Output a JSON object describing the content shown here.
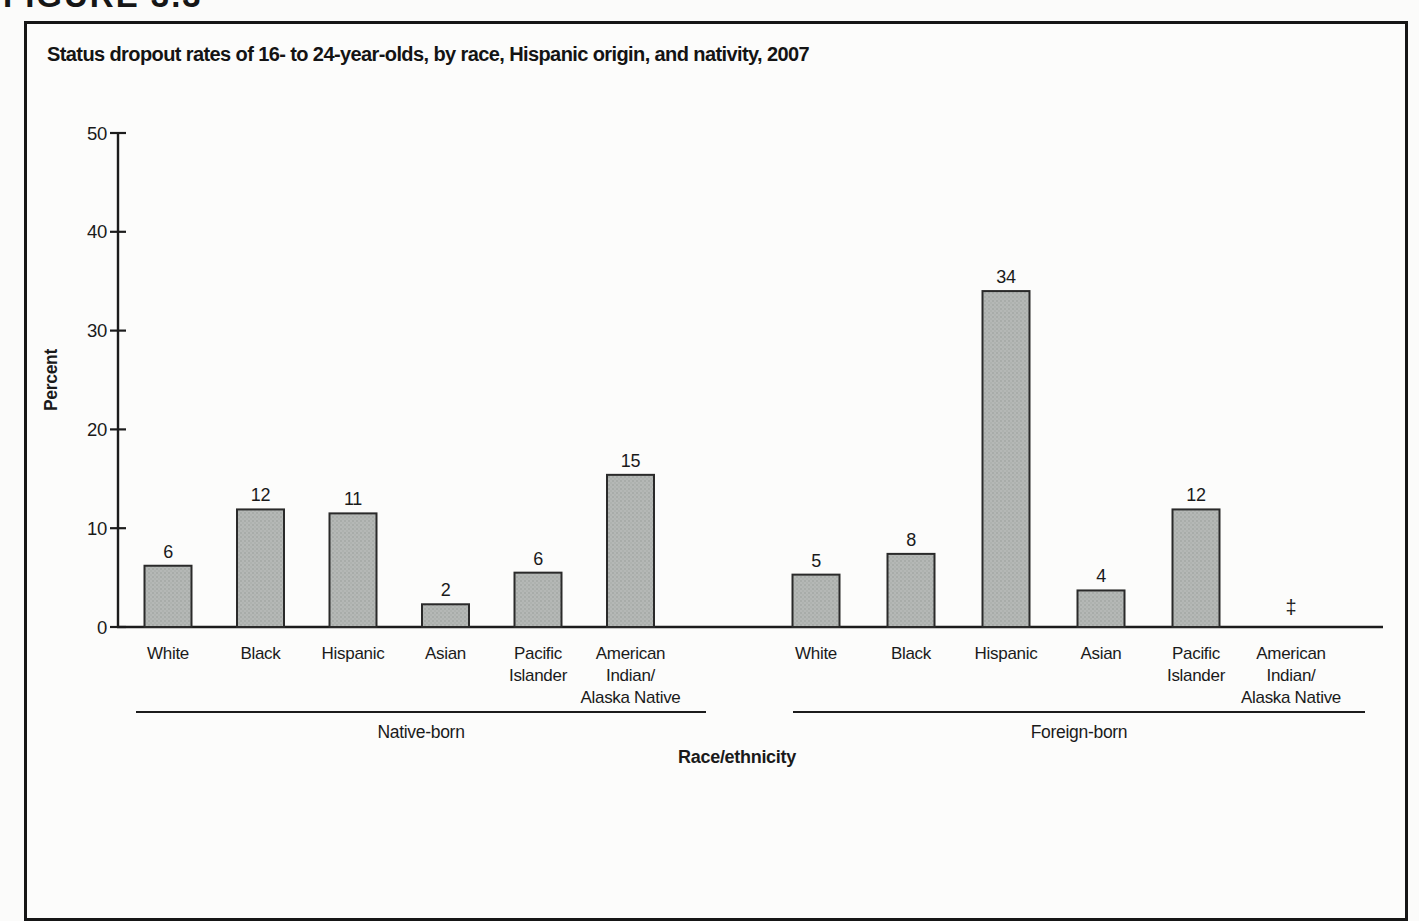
{
  "figure_label": "FIGURE 3.3",
  "chart_data": {
    "type": "bar",
    "title": "Status dropout rates of 16- to 24-year-olds, by race, Hispanic origin, and nativity, 2007",
    "xlabel": "Race/ethnicity",
    "ylabel": "Percent",
    "ylim": [
      0,
      50
    ],
    "yticks": [
      0,
      10,
      20,
      30,
      40,
      50
    ],
    "legend": "none",
    "grid": "off",
    "groups": [
      {
        "label": "Native-born",
        "bars": [
          {
            "name": "White",
            "lines": [
              "White"
            ],
            "value": 6,
            "height_pct": 6.2
          },
          {
            "name": "Black",
            "lines": [
              "Black"
            ],
            "value": 12,
            "height_pct": 11.9
          },
          {
            "name": "Hispanic",
            "lines": [
              "Hispanic"
            ],
            "value": 11,
            "height_pct": 11.5
          },
          {
            "name": "Asian",
            "lines": [
              "Asian"
            ],
            "value": 2,
            "height_pct": 2.3
          },
          {
            "name": "Pacific Islander",
            "lines": [
              "Pacific",
              "Islander"
            ],
            "value": 6,
            "height_pct": 5.5
          },
          {
            "name": "American Indian/Alaska Native",
            "lines": [
              "American",
              "Indian/",
              "Alaska Native"
            ],
            "value": 15,
            "height_pct": 15.4
          }
        ]
      },
      {
        "label": "Foreign-born",
        "bars": [
          {
            "name": "White",
            "lines": [
              "White"
            ],
            "value": 5,
            "height_pct": 5.3
          },
          {
            "name": "Black",
            "lines": [
              "Black"
            ],
            "value": 8,
            "height_pct": 7.4
          },
          {
            "name": "Hispanic",
            "lines": [
              "Hispanic"
            ],
            "value": 34,
            "height_pct": 34.0
          },
          {
            "name": "Asian",
            "lines": [
              "Asian"
            ],
            "value": 4,
            "height_pct": 3.7
          },
          {
            "name": "Pacific Islander",
            "lines": [
              "Pacific",
              "Islander"
            ],
            "value": 12,
            "height_pct": 11.9
          },
          {
            "name": "American Indian/Alaska Native",
            "lines": [
              "American",
              "Indian/",
              "Alaska Native"
            ],
            "value": "‡",
            "height_pct": null
          }
        ]
      }
    ]
  },
  "colors": {
    "bar_fill": "#b5b8b6",
    "bar_dot_a": "#a2a7a3",
    "bar_dot_b": "#abafac",
    "bar_stroke": "#2a2a2a",
    "axis": "#1c1c1c",
    "text": "#1a1a1a",
    "frame": "#161616"
  }
}
